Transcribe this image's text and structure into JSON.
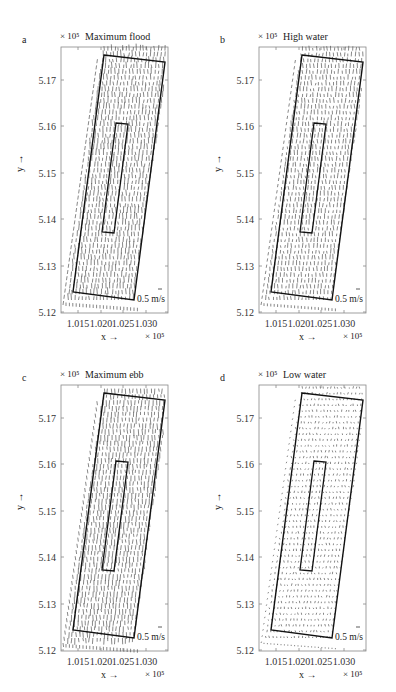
{
  "chart_data": [
    {
      "id": "a",
      "type": "quiver",
      "panel_letter": "a",
      "title": "Maximum flood",
      "y_multiplier": "× 10⁵",
      "x_multiplier": "× 10⁵",
      "xlabel": "x →",
      "ylabel": "y →",
      "xticks": [
        "1.015",
        "1.020",
        "1.025",
        "1.030"
      ],
      "yticks": [
        "5.12",
        "5.13",
        "5.14",
        "5.15",
        "5.16",
        "5.17"
      ],
      "xlim": [
        1.011,
        1.034
      ],
      "ylim": [
        5.12,
        5.177
      ],
      "scale_label": "0.5 m/s",
      "vector_direction": "northward (flood)",
      "vector_magnitude": "strong"
    },
    {
      "id": "b",
      "type": "quiver",
      "panel_letter": "b",
      "title": "High water",
      "y_multiplier": "× 10⁵",
      "x_multiplier": "× 10⁵",
      "xlabel": "x →",
      "ylabel": "y →",
      "xticks": [
        "1.015",
        "1.020",
        "1.025",
        "1.030"
      ],
      "yticks": [
        "5.12",
        "5.13",
        "5.14",
        "5.15",
        "5.16",
        "5.17"
      ],
      "xlim": [
        1.011,
        1.034
      ],
      "ylim": [
        5.12,
        5.177
      ],
      "scale_label": "0.5 m/s",
      "vector_direction": "northward (weakening)",
      "vector_magnitude": "moderate"
    },
    {
      "id": "c",
      "type": "quiver",
      "panel_letter": "c",
      "title": "Maximum ebb",
      "y_multiplier": "× 10⁵",
      "x_multiplier": "× 10⁵",
      "xlabel": "x →",
      "ylabel": "y →",
      "xticks": [
        "1.015",
        "1.020",
        "1.025",
        "1.030"
      ],
      "yticks": [
        "5.12",
        "5.13",
        "5.14",
        "5.15",
        "5.16",
        "5.17"
      ],
      "xlim": [
        1.011,
        1.034
      ],
      "ylim": [
        5.12,
        5.177
      ],
      "scale_label": "0.5 m/s",
      "vector_direction": "southward (ebb)",
      "vector_magnitude": "strong"
    },
    {
      "id": "d",
      "type": "quiver",
      "panel_letter": "d",
      "title": "Low water",
      "y_multiplier": "× 10⁵",
      "x_multiplier": "× 10⁵",
      "xlabel": "x →",
      "ylabel": "y →",
      "xticks": [
        "1.015",
        "1.020",
        "1.025",
        "1.030"
      ],
      "yticks": [
        "5.12",
        "5.13",
        "5.14",
        "5.15",
        "5.16",
        "5.17"
      ],
      "xlim": [
        1.011,
        1.034
      ],
      "ylim": [
        5.12,
        5.177
      ],
      "scale_label": "0.5 m/s",
      "vector_direction": "weak / slack",
      "vector_magnitude": "weak"
    }
  ],
  "colors": {
    "axes": "#888888",
    "outline": "#111111",
    "vectors": "#555555"
  }
}
